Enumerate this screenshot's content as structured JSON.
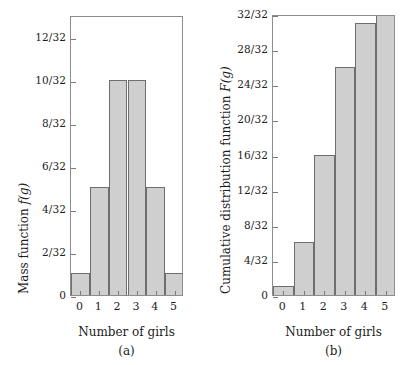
{
  "figure": {
    "background": "#ffffff",
    "bar_fill": "#cfcfcf",
    "bar_edge": "#6e6e6e",
    "frame_color": "#8d8d8d"
  },
  "chart_data": [
    {
      "type": "bar",
      "panel": "a",
      "caption": "(a)",
      "title": "",
      "xlabel": "Number of girls",
      "ylabel": "Mass function f(g)",
      "ylabel_text": "Mass function ",
      "ylabel_symbol": "f",
      "ylabel_arg": "(g)",
      "categories": [
        "0",
        "1",
        "2",
        "3",
        "4",
        "5"
      ],
      "values": [
        1,
        5,
        10,
        10,
        5,
        1
      ],
      "value_labels": [
        "1/32",
        "5/32",
        "10/32",
        "10/32",
        "5/32",
        "1/32"
      ],
      "denominator": 32,
      "ylim": [
        0,
        13
      ],
      "yticks": [
        0,
        2,
        4,
        6,
        8,
        10,
        12
      ],
      "ytick_labels": [
        "0",
        "2/32",
        "4/32",
        "6/32",
        "8/32",
        "10/32",
        "12/32"
      ],
      "xticks": [
        "0",
        "1",
        "2",
        "3",
        "4",
        "5"
      ],
      "grid": false,
      "legend": false
    },
    {
      "type": "bar",
      "panel": "b",
      "caption": "(b)",
      "title": "",
      "xlabel": "Number of girls",
      "ylabel": "Cumulative distribution function F(g)",
      "ylabel_text": "Cumulative distribution function ",
      "ylabel_symbol": "F",
      "ylabel_arg": "(g)",
      "categories": [
        "0",
        "1",
        "2",
        "3",
        "4",
        "5"
      ],
      "values": [
        1,
        6,
        16,
        26,
        31,
        32
      ],
      "value_labels": [
        "1/32",
        "6/32",
        "16/32",
        "26/32",
        "31/32",
        "32/32"
      ],
      "denominator": 32,
      "ylim": [
        0,
        32
      ],
      "yticks": [
        0,
        4,
        8,
        12,
        16,
        20,
        24,
        28,
        32
      ],
      "ytick_labels": [
        "0",
        "4/32",
        "8/32",
        "12/32",
        "16/32",
        "20/32",
        "24/32",
        "28/32",
        "32/32"
      ],
      "xticks": [
        "0",
        "1",
        "2",
        "3",
        "4",
        "5"
      ],
      "grid": false,
      "legend": false
    }
  ]
}
